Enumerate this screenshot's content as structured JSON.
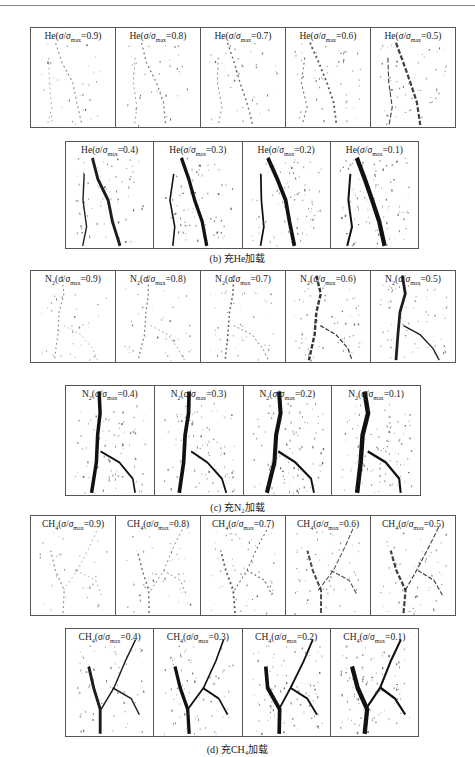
{
  "figure": {
    "sections": [
      {
        "id": "b",
        "gas": "He",
        "caption": "(b) 充He加载",
        "rows": [
          [
            {
              "gas": "He",
              "sub": "",
              "ratio": "0.9",
              "intensity": 0.15
            },
            {
              "gas": "He",
              "sub": "",
              "ratio": "0.8",
              "intensity": 0.2
            },
            {
              "gas": "He",
              "sub": "",
              "ratio": "0.7",
              "intensity": 0.25
            },
            {
              "gas": "He",
              "sub": "",
              "ratio": "0.6",
              "intensity": 0.35
            },
            {
              "gas": "He",
              "sub": "",
              "ratio": "0.5",
              "intensity": 0.45
            }
          ],
          [
            {
              "gas": "He",
              "sub": "",
              "ratio": "0.4",
              "intensity": 0.6
            },
            {
              "gas": "He",
              "sub": "",
              "ratio": "0.3",
              "intensity": 0.7
            },
            {
              "gas": "He",
              "sub": "",
              "ratio": "0.2",
              "intensity": 0.8
            },
            {
              "gas": "He",
              "sub": "",
              "ratio": "0.1",
              "intensity": 0.95
            }
          ]
        ]
      },
      {
        "id": "c",
        "gas": "N2",
        "caption": "(c) 充N₂加载",
        "rows": [
          [
            {
              "gas": "N",
              "sub": "2",
              "ratio": "0.9",
              "intensity": 0.15
            },
            {
              "gas": "N",
              "sub": "2",
              "ratio": "0.8",
              "intensity": 0.2
            },
            {
              "gas": "N",
              "sub": "2",
              "ratio": "0.7",
              "intensity": 0.3
            },
            {
              "gas": "N",
              "sub": "2",
              "ratio": "0.6",
              "intensity": 0.5
            },
            {
              "gas": "N",
              "sub": "2",
              "ratio": "0.5",
              "intensity": 0.6
            }
          ],
          [
            {
              "gas": "N",
              "sub": "2",
              "ratio": "0.4",
              "intensity": 0.75
            },
            {
              "gas": "N",
              "sub": "2",
              "ratio": "0.3",
              "intensity": 0.8
            },
            {
              "gas": "N",
              "sub": "2",
              "ratio": "0.2",
              "intensity": 0.9
            },
            {
              "gas": "N",
              "sub": "2",
              "ratio": "0.1",
              "intensity": 1.0
            }
          ]
        ]
      },
      {
        "id": "d",
        "gas": "CH4",
        "caption": "(d) 充CH₄加载",
        "rows": [
          [
            {
              "gas": "CH",
              "sub": "4",
              "ratio": "0.9",
              "intensity": 0.15
            },
            {
              "gas": "CH",
              "sub": "4",
              "ratio": "0.8",
              "intensity": 0.25
            },
            {
              "gas": "CH",
              "sub": "4",
              "ratio": "0.7",
              "intensity": 0.35
            },
            {
              "gas": "CH",
              "sub": "4",
              "ratio": "0.6",
              "intensity": 0.4
            },
            {
              "gas": "CH",
              "sub": "4",
              "ratio": "0.5",
              "intensity": 0.45
            }
          ],
          [
            {
              "gas": "CH",
              "sub": "4",
              "ratio": "0.4",
              "intensity": 0.6
            },
            {
              "gas": "CH",
              "sub": "4",
              "ratio": "0.3",
              "intensity": 0.7
            },
            {
              "gas": "CH",
              "sub": "4",
              "ratio": "0.2",
              "intensity": 0.8
            },
            {
              "gas": "CH",
              "sub": "4",
              "ratio": "0.1",
              "intensity": 0.95
            }
          ]
        ]
      }
    ],
    "label_symbol": "σ/σ",
    "label_sub": "max"
  }
}
